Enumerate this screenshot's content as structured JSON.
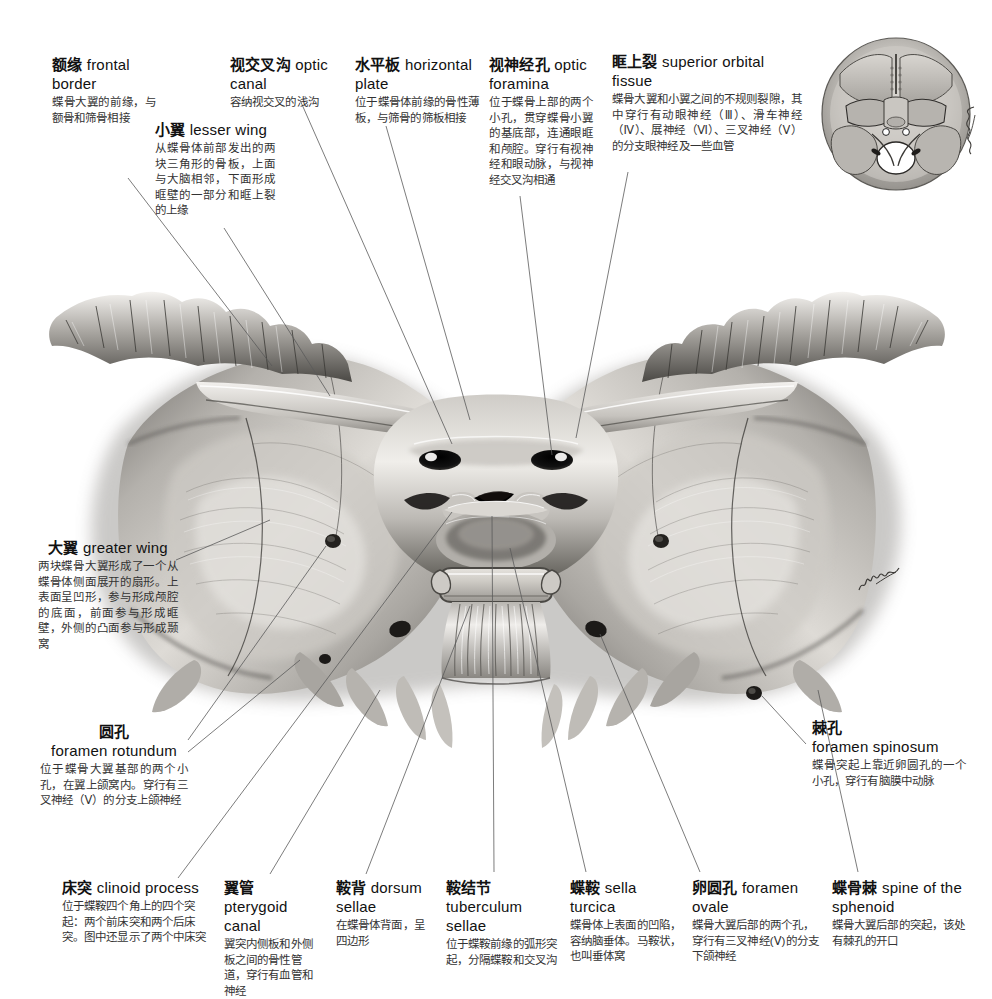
{
  "figure": {
    "artist_signature": "MacGillivray",
    "bone_tone_light": "#e9e7e4",
    "bone_tone_mid": "#9d9a95",
    "bone_tone_dark": "#2f2e2c",
    "leader_color": "#5a5a5a",
    "background": "#ffffff"
  },
  "labels": [
    {
      "id": "frontal-border",
      "cn": "额缘",
      "en": "frontal border",
      "desc": "蝶骨大翼的前缘，与额骨和筛骨相接"
    },
    {
      "id": "lesser-wing",
      "cn": "小翼",
      "en": "lesser wing",
      "desc": "从蝶骨体前部发出的两块三角形的骨板，上面与大脑相邻，下面形成眶壁的一部分和眶上裂的上缘"
    },
    {
      "id": "optic-canal",
      "cn": "视交叉沟",
      "en": "optic canal",
      "desc": "容纳视交叉的浅沟"
    },
    {
      "id": "horizontal-plate",
      "cn": "水平板",
      "en": "horizontal plate",
      "desc": "位于蝶骨体前缘的骨性薄板，与筛骨的筛板相接"
    },
    {
      "id": "optic-foramina",
      "cn": "视神经孔",
      "en": "optic foramina",
      "desc": "位于蝶骨上部的两个小孔，贯穿蝶骨小翼的基底部，连通眼眶和颅腔。穿行有视神经和眼动脉，与视神经交叉沟相通"
    },
    {
      "id": "superior-orbital-fissure",
      "cn": "眶上裂",
      "en": "superior orbital fissue",
      "desc": "蝶骨大翼和小翼之间的不规则裂隙，其中穿行有动眼神经（Ⅲ）、滑车神经（Ⅳ）、展神经（Ⅵ）、三叉神经（Ⅴ）的分支眼神经及一些血管"
    },
    {
      "id": "greater-wing",
      "cn": "大翼",
      "en": "greater wing",
      "desc": "两块蝶骨大翼形成了一个从蝶骨体侧面展开的扇形。上表面呈凹形，参与形成颅腔的底面，前面参与形成眶壁，外侧的凸面参与形成颞窝"
    },
    {
      "id": "foramen-rotundum",
      "cn": "圆孔",
      "en": "foramen rotundum",
      "desc": "位于蝶骨大翼基部的两个小孔，在翼上颌窝内。穿行有三叉神经（Ⅴ）的分支上颌神经"
    },
    {
      "id": "foramen-spinosum",
      "cn": "棘孔",
      "en": "foramen spinosum",
      "desc": "蝶骨突起上靠近卵圆孔的一个小孔，穿行有脑膜中动脉"
    },
    {
      "id": "clinoid-process",
      "cn": "床突",
      "en": "clinoid process",
      "desc": "位于蝶鞍四个角上的四个突起：两个前床突和两个后床突。图中还显示了两个中床突"
    },
    {
      "id": "pterygoid-canal",
      "cn": "翼管",
      "en": "pterygoid canal",
      "desc": "翼突内侧板和外侧板之间的骨性管道，穿行有血管和神经"
    },
    {
      "id": "dorsum-sellae",
      "cn": "鞍背",
      "en": "dorsum sellae",
      "desc": "在蝶骨体背面，呈四边形"
    },
    {
      "id": "tuberculum-sellae",
      "cn": "鞍结节",
      "en": "tuberculum sellae",
      "desc": "位于蝶鞍前缘的弧形突起，分隔蝶鞍和交叉沟"
    },
    {
      "id": "sella-turcica",
      "cn": "蝶鞍",
      "en": "sella turcica",
      "desc": "蝶骨体上表面的凹陷，容纳脑垂体。马鞍状，也叫垂体窝"
    },
    {
      "id": "foramen-ovale",
      "cn": "卵圆孔",
      "en": "foramen ovale",
      "desc": "蝶骨大翼后部的两个孔，穿行有三叉神经(Ⅴ)的分支下颌神经"
    },
    {
      "id": "spine-of-the-sphenoid",
      "cn": "蝶骨棘",
      "en": "spine of the sphenoid",
      "desc": "蝶骨大翼后部的突起，该处有棘孔的开口"
    }
  ],
  "inset": {
    "name": "cranial-base-superior-view",
    "description": "颅底内面观"
  }
}
